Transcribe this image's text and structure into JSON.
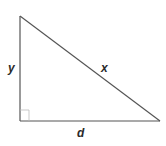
{
  "diagram": {
    "type": "right-triangle",
    "labels": {
      "vertical_side": "y",
      "hypotenuse": "x",
      "base": "d"
    },
    "stroke_color": "#555555",
    "right_angle_marker": true
  }
}
